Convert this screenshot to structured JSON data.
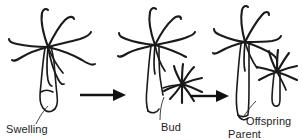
{
  "figure": {
    "background_color": "#ffffff",
    "ink_color": "#1a1a1a",
    "width": 302,
    "height": 140
  },
  "labels": {
    "swelling": "Swelling",
    "bud": "Bud",
    "offspring": "Offspring",
    "parent": "Parent"
  },
  "stages": [
    {
      "name": "stage-1-swelling",
      "caption": "Swelling",
      "description": "Hydra with tentacle crown and a swelling on the lower body column"
    },
    {
      "name": "stage-2-bud",
      "caption": "Bud",
      "description": "Hydra with a developed bud bearing its own tentacles on the side of the column"
    },
    {
      "name": "stage-3-parent-offspring",
      "caption": "Parent",
      "description": "Parent hydra beside a detached offspring hydra"
    }
  ],
  "arrows": [
    {
      "name": "arrow-stage1-to-stage2",
      "direction": "right"
    },
    {
      "name": "arrow-stage2-to-stage3",
      "direction": "right"
    }
  ]
}
